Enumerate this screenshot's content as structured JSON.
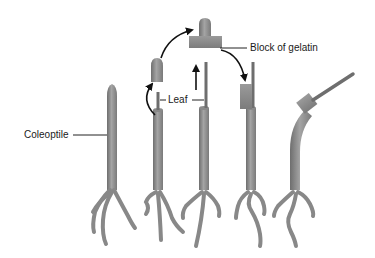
{
  "diagram": {
    "type": "coleoptile-phototropism-experiment",
    "labels": {
      "coleoptile": "Coleoptile",
      "leaf": "Leaf",
      "gelatin": "Block of gelatin"
    },
    "stages": [
      {
        "id": 1,
        "description": "Intact coleoptile"
      },
      {
        "id": 2,
        "description": "Tip removed from coleoptile, leaf exposed"
      },
      {
        "id": 3,
        "description": "Tip placed on block of gelatin; leaf pulled up"
      },
      {
        "id": 4,
        "description": "Gelatin block placed on cut coleoptile beside leaf"
      },
      {
        "id": 5,
        "description": "Coleoptile bends with gelatin block offset"
      }
    ],
    "colors": {
      "stem": "#8a8a8a",
      "stem_dark": "#6e6e6e",
      "stem_light": "#a8a8a8",
      "arrow": "#111111",
      "label_line": "#222222",
      "background": "#ffffff"
    }
  }
}
